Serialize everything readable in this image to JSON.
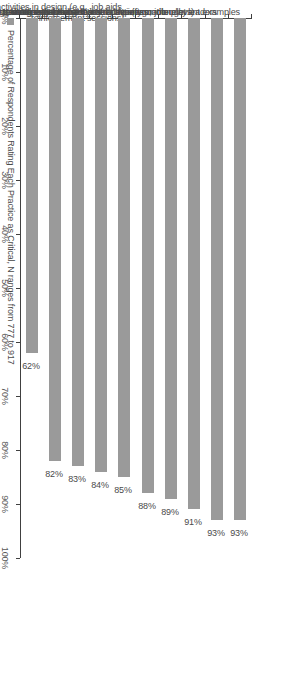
{
  "chart_data": {
    "type": "bar",
    "orientation": "vertical-rotated",
    "title": "",
    "xlabel": "",
    "ylabel": "",
    "ylim": [
      0,
      100
    ],
    "grid": false,
    "legend_position": "bottom-left",
    "categories": [
      "Use industry, company or job-relevant examples",
      "Involve subject matter experts or thought leaders",
      "Make training engaging and interactive (e.g., role plays)",
      "Use research-based or reliable information",
      "Incorporate experiential learning activities",
      "Include post-training activities in design (e.g., job aids, reinforcement sessions)",
      "Use blended methods to accommodate multiple learning styles",
      "Create easy-to-use support materials (e.g., videos, manuals)",
      "Use creativity or innovation in design (e.g., with new technologies)",
      "Transition course materials to those who requested the training"
    ],
    "category_lines": [
      [
        "Use industry, company or job-relevant examples"
      ],
      [
        "Involve subject matter experts or thought leaders"
      ],
      [
        "Make training engaging and interactive (e.g., role plays)"
      ],
      [
        "Use research-based or reliable information"
      ],
      [
        "Incorporate experiential learning activities"
      ],
      [
        "Include post-training activities in design (e.g., job aids,",
        "reinforcement sessions)"
      ],
      [
        "Use blended methods to accommodate multiple learning styles"
      ],
      [
        "Create easy-to-use support materials (e.g., videos, manuals)"
      ],
      [
        "Use creativity or innovation in design (e.g., with new technologies)"
      ],
      [
        "Transition course materials to those who requested the training"
      ]
    ],
    "values": [
      93,
      93,
      91,
      89,
      88,
      85,
      84,
      83,
      82,
      62
    ],
    "value_labels": [
      "93%",
      "93%",
      "91%",
      "89%",
      "88%",
      "85%",
      "84%",
      "83%",
      "82%",
      "62%"
    ],
    "axis_ticks": [
      0,
      10,
      20,
      30,
      40,
      50,
      60,
      70,
      80,
      90,
      100
    ],
    "axis_tick_labels": [
      "0%",
      "10%",
      "20%",
      "30%",
      "40%",
      "50%",
      "60%",
      "70%",
      "80%",
      "90%",
      "100%"
    ],
    "series": [
      {
        "name": "Percentage of Respondents Rating Each Practice as Critical, N ranges from 777 to 917",
        "color": "#9a9a9a",
        "values": [
          93,
          93,
          91,
          89,
          88,
          85,
          84,
          83,
          82,
          62
        ]
      }
    ]
  },
  "legend": {
    "label": "Percentage of Respondents Rating Each Practice as Critical, N ranges from 777 to 917",
    "swatch_color": "#9a9a9a"
  },
  "colors": {
    "bar": "#9a9a9a",
    "axis": "#404040",
    "text": "#4a4a4a",
    "background": "#ffffff"
  }
}
